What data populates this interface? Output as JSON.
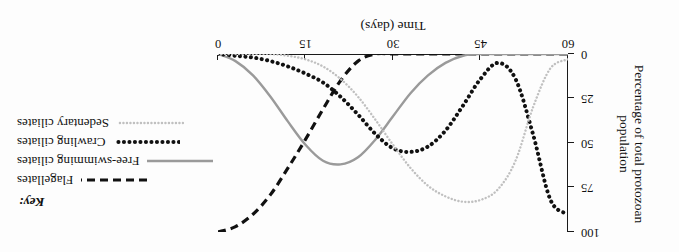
{
  "figure": {
    "orientation_note": "upside-down",
    "background": "#fdfdfd"
  },
  "axes": {
    "x_title": "Time (days)",
    "x_ticks": [
      "0",
      "15",
      "30",
      "45",
      "60"
    ],
    "y_title": "Percentage of total protozoan population",
    "y_ticks": [
      "0",
      "25",
      "50",
      "75",
      "100"
    ]
  },
  "legend": {
    "title": "Key:",
    "items": [
      {
        "label": "Flagellates",
        "style": "dashed",
        "color": "#111111"
      },
      {
        "label": "Free-swimming ciliates",
        "style": "solid",
        "color": "#9a9a9a"
      },
      {
        "label": "Crawling ciliates",
        "style": "bold-dotted",
        "color": "#111111"
      },
      {
        "label": "Sedentary ciliates",
        "style": "fine-dotted",
        "color": "#c0c0c0"
      }
    ]
  },
  "chart_data": {
    "type": "line",
    "title": "",
    "xlabel": "Time (days)",
    "ylabel": "Percentage of total protozoan population",
    "xlim": [
      0,
      60
    ],
    "ylim": [
      0,
      100
    ],
    "y_inverted": true,
    "grid": false,
    "legend_position": "left",
    "x_ticks": [
      0,
      15,
      30,
      45,
      60
    ],
    "y_ticks": [
      0,
      25,
      50,
      75,
      100
    ],
    "x": [
      0,
      3,
      6,
      9,
      12,
      15,
      18,
      21,
      24,
      27,
      30,
      33,
      36,
      39,
      42,
      45,
      48,
      51,
      54,
      57,
      60
    ],
    "series": [
      {
        "name": "Flagellates",
        "color": "#111111",
        "dash": "dashed",
        "values": [
          100,
          97,
          90,
          79,
          64,
          48,
          31,
          15,
          4,
          0,
          0,
          0,
          0,
          0,
          0,
          0,
          0,
          0,
          0,
          0,
          0
        ]
      },
      {
        "name": "Free-swimming ciliates",
        "color": "#9a9a9a",
        "dash": "solid",
        "values": [
          0,
          4,
          12,
          24,
          38,
          51,
          60,
          62,
          58,
          48,
          35,
          22,
          12,
          5,
          1,
          0,
          0,
          0,
          0,
          0,
          0
        ]
      },
      {
        "name": "Crawling ciliates",
        "color": "#111111",
        "dash": "bold-dotted",
        "values": [
          0,
          1,
          2,
          4,
          7,
          11,
          16,
          24,
          34,
          45,
          53,
          55,
          52,
          43,
          29,
          14,
          5,
          14,
          45,
          82,
          90
        ]
      },
      {
        "name": "Sedentary ciliates",
        "color": "#c0c0c0",
        "dash": "fine-dotted",
        "values": [
          0,
          0,
          0,
          0,
          1,
          3,
          7,
          14,
          24,
          37,
          51,
          64,
          74,
          80,
          83,
          82,
          76,
          60,
          30,
          8,
          3
        ]
      }
    ]
  }
}
